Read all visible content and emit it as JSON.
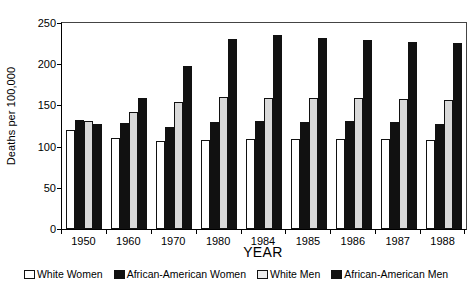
{
  "chart_data": {
    "type": "bar",
    "title": "",
    "xlabel": "YEAR",
    "ylabel": "Deaths per 100,000",
    "ylim": [
      0,
      250
    ],
    "yticks": [
      0,
      50,
      100,
      150,
      200,
      250
    ],
    "grid": false,
    "legend_position": "bottom",
    "categories": [
      "1950",
      "1960",
      "1970",
      "1980",
      "1984",
      "1985",
      "1986",
      "1987",
      "1988"
    ],
    "series": [
      {
        "name": "White Women",
        "color": "#ffffff",
        "values": [
          120,
          110,
          107,
          108,
          109,
          109,
          109,
          109,
          108
        ]
      },
      {
        "name": "African-American Women",
        "color": "#111111",
        "values": [
          132,
          129,
          124,
          130,
          131,
          130,
          131,
          130,
          128
        ]
      },
      {
        "name": "White Men",
        "color": "#d9d9d9",
        "values": [
          131,
          142,
          154,
          160,
          159,
          159,
          159,
          158,
          157
        ]
      },
      {
        "name": "African-American Men",
        "color": "#111111",
        "values": [
          127,
          159,
          198,
          231,
          236,
          232,
          229,
          227,
          226
        ]
      }
    ]
  }
}
